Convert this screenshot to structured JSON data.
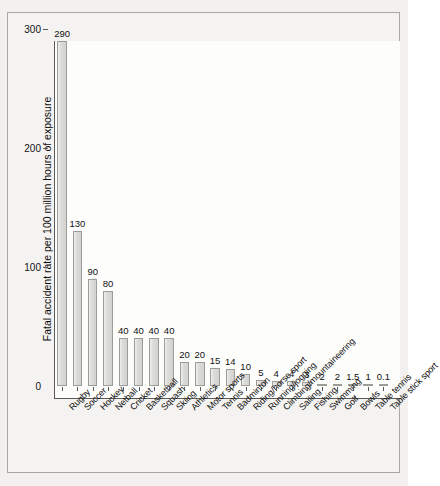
{
  "chart_data": {
    "type": "bar",
    "title": "",
    "xlabel": "",
    "ylabel": "Fatal accident rate per 100 million hours of exposure",
    "ylim": [
      0,
      300
    ],
    "yticks": [
      0,
      100,
      200,
      300
    ],
    "grid": false,
    "legend": null,
    "categories": [
      "Rugby",
      "Soccer",
      "Hockey",
      "Netball",
      "Cricket",
      "Basketball",
      "Squash",
      "Skiing",
      "Athletics",
      "Motor sports",
      "Tennis",
      "Badminton",
      "Riding/horse sport",
      "Running/jogging",
      "Climbing/mountaineering",
      "Sailing",
      "Fishing",
      "Swimming",
      "Golf",
      "Bowls",
      "Table tennis",
      "Table stick sport"
    ],
    "values": [
      290,
      130,
      90,
      80,
      40,
      40,
      40,
      40,
      20,
      20,
      15,
      14,
      10,
      5,
      4,
      4,
      3,
      2,
      2,
      1.5,
      1,
      0.1
    ],
    "value_labels": [
      "290",
      "130",
      "90",
      "80",
      "40",
      "40",
      "40",
      "40",
      "20",
      "20",
      "15",
      "14",
      "10",
      "5",
      "4",
      "4",
      "3",
      "2",
      "2",
      "1.5",
      "1",
      "0.1"
    ],
    "bar_color": "#d9d9d7",
    "bar_edge_color": "#9c9c99",
    "axis_color": "#5a5a58",
    "plot_background": "#fdfdfc",
    "figure_background": "#f4f3f1"
  }
}
